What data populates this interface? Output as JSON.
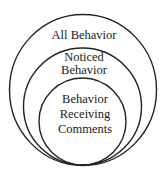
{
  "diagram": {
    "type": "nested-circles",
    "stroke_color": "#222222",
    "background": "#ffffff",
    "circles": [
      {
        "name": "all-behavior",
        "lines": [
          "All Behavior"
        ]
      },
      {
        "name": "noticed-behavior",
        "lines": [
          "Noticed",
          "Behavior"
        ]
      },
      {
        "name": "behavior-receiving-comments",
        "lines": [
          "Behavior",
          "Receiving",
          "Comments"
        ]
      }
    ]
  }
}
